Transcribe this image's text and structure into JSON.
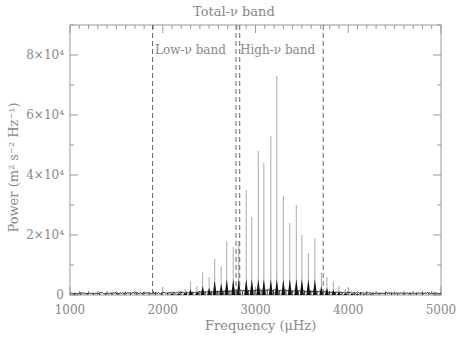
{
  "chart_data": {
    "type": "line",
    "title": "",
    "xlabel": "Frequency (μHz)",
    "ylabel": "Power (m² s⁻² Hz⁻¹)",
    "xlim": [
      1000,
      5000
    ],
    "ylim": [
      0,
      90000
    ],
    "x_ticks": [
      "1000",
      "2000",
      "3000",
      "4000",
      "5000"
    ],
    "y_ticks": [
      "0",
      "2×10⁴",
      "4×10⁴",
      "6×10⁴",
      "8×10⁴"
    ],
    "annotations": [
      {
        "text": "Total-ν band",
        "range": [
          1890,
          3730
        ]
      },
      {
        "text": "Low-ν band",
        "range": [
          1890,
          2790
        ]
      },
      {
        "text": "High-ν band",
        "range": [
          2830,
          3730
        ]
      }
    ],
    "band_boundaries": [
      1890,
      2790,
      2830,
      3730
    ],
    "peaks": {
      "x": [
        2100,
        2170,
        2240,
        2300,
        2370,
        2430,
        2500,
        2560,
        2630,
        2690,
        2760,
        2820,
        2900,
        2960,
        3030,
        3090,
        3165,
        3230,
        3300,
        3370,
        3440,
        3500,
        3570,
        3640,
        3710,
        3770,
        3840,
        3900,
        3970,
        4040,
        4100,
        4170,
        4240
      ],
      "y": [
        1000,
        1500,
        2000,
        4500,
        3000,
        7500,
        6000,
        12000,
        9500,
        18000,
        16000,
        18000,
        35000,
        26000,
        48000,
        44000,
        53000,
        73000,
        33000,
        24000,
        30000,
        20000,
        14000,
        19000,
        7500,
        6000,
        4500,
        3000,
        2000,
        1500,
        1200,
        900,
        700
      ]
    }
  },
  "axes": {
    "xlabel": "Frequency (μHz)",
    "ylabel": "Power (m² s⁻² Hz⁻¹)",
    "top_label": "Total-ν band",
    "low_label": "Low-ν band",
    "high_label": "High-ν band"
  }
}
